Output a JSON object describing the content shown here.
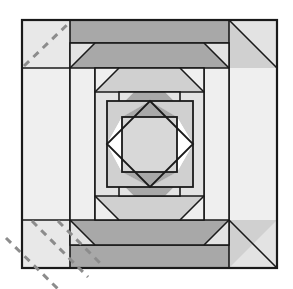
{
  "figure": {
    "canvas": {
      "width": 293,
      "height": 289,
      "background": "#ffffff"
    }
  },
  "palette": {
    "white": "#ffffff",
    "light_gray": "#e3e3e3",
    "mid_gray": "#d0d0d0",
    "dark_gray": "#a8a8a8",
    "outline": "#1a1a1a",
    "dash_gray": "#8c8c8c"
  },
  "block": {
    "name": "quilt-block",
    "outer_bounds": {
      "x": 22,
      "y": 20,
      "width": 255,
      "height": 248
    },
    "center": {
      "cx": 149.5,
      "cy": 144
    },
    "ring_offsets": [
      0,
      23,
      48,
      72,
      92
    ],
    "rings": [
      {
        "index": 0,
        "label": "outer-ring",
        "fill": "light_gray",
        "corner_fill": "light_gray"
      },
      {
        "index": 1,
        "label": "ring-two",
        "fill": "dark_gray",
        "corner_fill": "light_gray"
      },
      {
        "index": 2,
        "label": "ring-three",
        "fill": "mid_gray",
        "corner_fill": "light_gray"
      },
      {
        "index": 3,
        "label": "ring-four",
        "fill": "dark_gray",
        "corner_fill": "light_gray"
      },
      {
        "index": 4,
        "label": "ring-five",
        "fill": "mid_gray",
        "corner_fill": "light_gray"
      }
    ]
  },
  "center_unit": {
    "name": "center-square-in-square",
    "outer_square": {
      "x": 107,
      "y": 101,
      "width": 86,
      "height": 86,
      "fill": "mid_gray"
    },
    "diamond_points": "150,101 193,144 150,187 107,144",
    "inner_square": {
      "x": 122,
      "y": 117,
      "width": 55,
      "height": 55,
      "fill": "mid_gray"
    },
    "triangles": [
      {
        "name": "diamond-top-triangle",
        "fill": "dark_gray"
      },
      {
        "name": "diamond-bottom-triangle",
        "fill": "dark_gray"
      },
      {
        "name": "diamond-left-triangle",
        "fill": "white"
      },
      {
        "name": "diamond-right-triangle",
        "fill": "white"
      }
    ]
  },
  "guides": {
    "name": "cutting-guide-lines",
    "stroke": "#8c8c8c",
    "dash_pattern": "7 6",
    "stroke_width": 3,
    "upper_left": [
      {
        "name": "guide-line-top-left-1",
        "x1": 24,
        "y1": 66,
        "x2": 70,
        "y2": 22
      }
    ],
    "lower_left": [
      {
        "name": "guide-line-bottom-left-1",
        "x1": 6,
        "y1": 238,
        "x2": 56,
        "y2": 288
      },
      {
        "name": "guide-line-bottom-left-2",
        "x1": 30,
        "y1": 222,
        "x2": 84,
        "y2": 276
      },
      {
        "name": "guide-line-bottom-left-3",
        "x1": 55,
        "y1": 222,
        "x2": 100,
        "y2": 267
      }
    ]
  },
  "corner_blocks": {
    "top_left": {
      "name": "corner-block-top-left",
      "x": 22,
      "y": 20,
      "width": 48,
      "height": 48,
      "fill": "light_gray"
    },
    "bottom_left": {
      "name": "corner-block-bottom-left",
      "x": 22,
      "y": 220,
      "width": 48,
      "height": 48,
      "fill": "light_gray"
    }
  }
}
